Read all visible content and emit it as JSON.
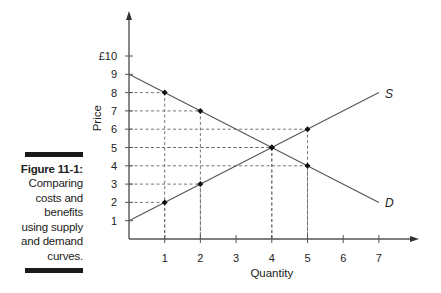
{
  "caption": {
    "figure_label": "Figure 11-1:",
    "lines": [
      "Comparing",
      "costs and",
      "benefits",
      "using supply",
      "and demand",
      "curves."
    ]
  },
  "chart_data": {
    "type": "line",
    "title": "",
    "xlabel": "Quantity",
    "ylabel": "Price",
    "xlim": [
      0,
      7
    ],
    "ylim": [
      0,
      10
    ],
    "x_ticks": [
      1,
      2,
      3,
      4,
      5,
      6,
      7
    ],
    "x_tick_labels": [
      "1",
      "2",
      "3",
      "4",
      "5",
      "6",
      "7"
    ],
    "y_ticks": [
      1,
      2,
      3,
      4,
      5,
      6,
      7,
      8,
      9,
      10
    ],
    "y_tick_labels": [
      "1",
      "2",
      "3",
      "4",
      "5",
      "6",
      "7",
      "8",
      "9",
      "£10"
    ],
    "grid": false,
    "series": [
      {
        "name": "S",
        "label": "S",
        "line": [
          [
            0,
            1
          ],
          [
            7,
            8
          ]
        ],
        "points": [
          [
            1,
            2
          ],
          [
            2,
            3
          ],
          [
            4,
            5
          ],
          [
            5,
            6
          ]
        ]
      },
      {
        "name": "D",
        "label": "D",
        "line": [
          [
            0,
            9
          ],
          [
            7,
            2
          ]
        ],
        "points": [
          [
            1,
            8
          ],
          [
            2,
            7
          ],
          [
            4,
            5
          ],
          [
            5,
            4
          ]
        ]
      }
    ],
    "guide_lines": "dashed from each marked point to both axes"
  }
}
